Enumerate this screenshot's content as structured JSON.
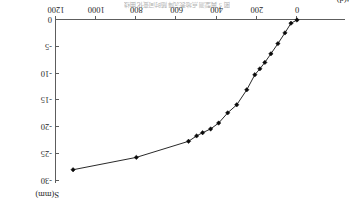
{
  "figure": {
    "caption": "图 5  典型测点地表沉降随时间变化曲线",
    "orientation_note": "rotated-180"
  },
  "chart_data": {
    "type": "line",
    "title": "图 5  典型测点地表沉降随时间变化曲线",
    "xlabel": "t(d)",
    "ylabel": "S(mm)",
    "xlim": [
      0,
      1200
    ],
    "ylim": [
      -30,
      0
    ],
    "xticks": [
      0,
      200,
      400,
      600,
      800,
      1000,
      1200
    ],
    "xtick_labels": [
      "0",
      "200",
      "400",
      "600",
      "800",
      "1000",
      "1200"
    ],
    "yticks": [
      0,
      -5,
      -10,
      -15,
      -20,
      -25,
      -30
    ],
    "ytick_labels": [
      "0",
      "-5",
      "-10",
      "-15",
      "-20",
      "-25",
      "-30"
    ],
    "grid": false,
    "legend": null,
    "x_axis_direction": "increasing-right",
    "y_axis_side": "left",
    "series": [
      {
        "name": "地表沉降 S",
        "marker": "diamond",
        "color": "#111111",
        "x": [
          0,
          30,
          60,
          95,
          130,
          160,
          185,
          210,
          250,
          300,
          345,
          390,
          430,
          470,
          500,
          540,
          800,
          1115
        ],
        "y": [
          0,
          -0.6,
          -2.4,
          -4.4,
          -6.3,
          -7.9,
          -9.1,
          -10.2,
          -13.0,
          -15.8,
          -17.3,
          -19.2,
          -20.3,
          -21.0,
          -21.6,
          -22.6,
          -25.6,
          -27.9
        ]
      }
    ]
  }
}
